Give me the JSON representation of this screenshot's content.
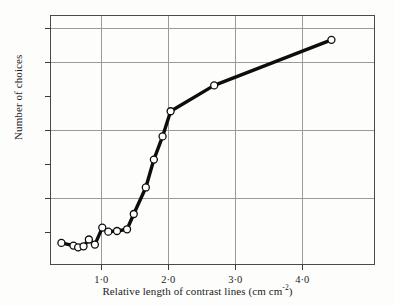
{
  "chart_data": {
    "type": "line",
    "title": "",
    "xlabel": "Relative length of contrast lines (cm cm",
    "xlabel_sup": "-2",
    "xlabel_tail": ")",
    "ylabel": "Number of choices",
    "xlim": [
      0.25,
      5.1
    ],
    "ylim": [
      0,
      735
    ],
    "grid": true,
    "legend": null,
    "marker": "open-circle",
    "x_ticks": [
      1.0,
      2.0,
      3.0,
      4.0
    ],
    "x_tick_labels": [
      "1·0",
      "2·0",
      "3·0",
      "4·0"
    ],
    "y_ticks": [
      100,
      200,
      300,
      400,
      500,
      600,
      700
    ],
    "y_tick_labels": [
      "100",
      "200",
      "300",
      "400",
      "500",
      "600",
      "700"
    ],
    "gridlines_x": [
      1.0,
      2.0,
      3.0,
      4.0
    ],
    "gridlines_y": [
      200,
      400,
      600,
      700
    ],
    "x": [
      0.42,
      0.6,
      0.67,
      0.75,
      0.83,
      0.92,
      1.03,
      1.12,
      1.25,
      1.4,
      1.5,
      1.68,
      1.8,
      1.93,
      2.05,
      2.7,
      4.45
    ],
    "values": [
      65,
      57,
      52,
      55,
      75,
      60,
      110,
      98,
      100,
      105,
      150,
      228,
      310,
      378,
      452,
      528,
      662
    ],
    "series": [
      {
        "name": "Number of choices",
        "x": [
          0.42,
          0.6,
          0.67,
          0.75,
          0.83,
          0.92,
          1.03,
          1.12,
          1.25,
          1.4,
          1.5,
          1.68,
          1.8,
          1.93,
          2.05,
          2.7,
          4.45
        ],
        "values": [
          65,
          57,
          52,
          55,
          75,
          60,
          110,
          98,
          100,
          105,
          150,
          228,
          310,
          378,
          452,
          528,
          662
        ],
        "color": "#000000"
      }
    ]
  },
  "style": {
    "line_color": "#0d0d0d",
    "marker_fill": "#ffffff",
    "marker_stroke": "#0d0d0d",
    "grid_color": "#9a9a9a",
    "frame_color": "#4a4a4a",
    "background": "#fdfdfc"
  }
}
